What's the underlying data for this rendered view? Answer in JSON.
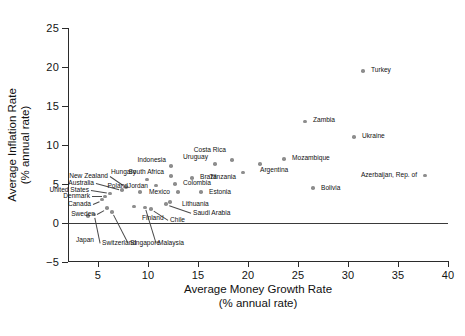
{
  "chart_data": {
    "type": "scatter",
    "title": "",
    "xlabel": "Average Money Growth Rate",
    "xlabel2": "(% annual rate)",
    "ylabel": "Average Inflation Rate",
    "ylabel2": "(% annual rate)",
    "xlim": [
      2.0,
      40.0
    ],
    "ylim": [
      -5,
      25
    ],
    "xticks": [
      5,
      10,
      15,
      20,
      25,
      30,
      35,
      40
    ],
    "yticks": [
      -5,
      0,
      5,
      10,
      15,
      20,
      25
    ],
    "grid": false,
    "legend": "none",
    "zero_reference_line": 0,
    "points": [
      {
        "name": "Switzerland",
        "x": 4.6,
        "y": 1.1,
        "lx": 5.2,
        "ly": -2.6,
        "anchor": "start",
        "leader": true
      },
      {
        "name": "Japan",
        "x": 4.0,
        "y": 0.9,
        "lx": 2.6,
        "ly": -2.2,
        "anchor": "start",
        "leader": false
      },
      {
        "name": "Singapore",
        "x": 6.4,
        "y": 1.4,
        "lx": 8.0,
        "ly": -2.6,
        "anchor": "start",
        "leader": true
      },
      {
        "name": "Sweden",
        "x": 5.9,
        "y": 1.9,
        "lx": 4.9,
        "ly": 1.2,
        "anchor": "end",
        "leader": true
      },
      {
        "name": "Canada",
        "x": 5.4,
        "y": 3.0,
        "lx": 4.5,
        "ly": 2.5,
        "anchor": "end",
        "leader": true
      },
      {
        "name": "Denmark",
        "x": 5.7,
        "y": 3.4,
        "lx": 4.4,
        "ly": 3.4,
        "anchor": "end",
        "leader": true
      },
      {
        "name": "United States",
        "x": 6.2,
        "y": 3.8,
        "lx": 4.3,
        "ly": 4.2,
        "anchor": "end",
        "leader": true
      },
      {
        "name": "Australia",
        "x": 7.4,
        "y": 4.2,
        "lx": 4.8,
        "ly": 5.1,
        "anchor": "end",
        "leader": true
      },
      {
        "name": "New Zealand",
        "x": 7.8,
        "y": 4.6,
        "lx": 6.2,
        "ly": 6.0,
        "anchor": "end",
        "leader": true
      },
      {
        "name": "Malaysia",
        "x": 9.7,
        "y": 2.0,
        "lx": 10.8,
        "ly": -2.6,
        "anchor": "start",
        "leader": true
      },
      {
        "name": "Finland",
        "x": 8.6,
        "y": 2.1,
        "lx": 9.2,
        "ly": 0.6,
        "anchor": "start",
        "leader": false
      },
      {
        "name": "Chile",
        "x": 10.3,
        "y": 1.8,
        "lx": 12.0,
        "ly": 0.4,
        "anchor": "start",
        "leader": true
      },
      {
        "name": "Poland",
        "x": 9.2,
        "y": 4.0,
        "lx": 8.2,
        "ly": 4.7,
        "anchor": "end",
        "leader": false
      },
      {
        "name": "Hungary",
        "x": 9.9,
        "y": 5.6,
        "lx": 9.0,
        "ly": 6.5,
        "anchor": "end",
        "leader": false
      },
      {
        "name": "Jordan",
        "x": 10.8,
        "y": 4.8,
        "lx": 10.2,
        "ly": 4.8,
        "anchor": "end",
        "leader": false
      },
      {
        "name": "Lithuania",
        "x": 12.2,
        "y": 2.7,
        "lx": 13.2,
        "ly": 2.4,
        "anchor": "start",
        "leader": false
      },
      {
        "name": "Saudi Arabia",
        "x": 11.8,
        "y": 2.4,
        "lx": 14.3,
        "ly": 1.3,
        "anchor": "start",
        "leader": true
      },
      {
        "name": "Mexico",
        "x": 13.0,
        "y": 4.0,
        "lx": 12.4,
        "ly": 4.0,
        "anchor": "end",
        "leader": false
      },
      {
        "name": "Colombia",
        "x": 12.7,
        "y": 5.0,
        "lx": 13.3,
        "ly": 5.1,
        "anchor": "start",
        "leader": false
      },
      {
        "name": "South Africa",
        "x": 12.3,
        "y": 6.0,
        "lx": 11.8,
        "ly": 6.5,
        "anchor": "end",
        "leader": false
      },
      {
        "name": "Indonesia",
        "x": 12.3,
        "y": 7.3,
        "lx": 12.0,
        "ly": 8.1,
        "anchor": "end",
        "leader": false
      },
      {
        "name": "Brazil",
        "x": 14.4,
        "y": 5.8,
        "lx": 15.0,
        "ly": 5.9,
        "anchor": "start",
        "leader": false
      },
      {
        "name": "Estonia",
        "x": 15.3,
        "y": 4.0,
        "lx": 15.9,
        "ly": 4.0,
        "anchor": "start",
        "leader": false
      },
      {
        "name": "Uruguay",
        "x": 16.7,
        "y": 7.6,
        "lx": 16.2,
        "ly": 8.5,
        "anchor": "end",
        "leader": false
      },
      {
        "name": "Costa Rica",
        "x": 18.4,
        "y": 8.1,
        "lx": 18.0,
        "ly": 9.3,
        "anchor": "end",
        "leader": false
      },
      {
        "name": "Tanzania",
        "x": 19.5,
        "y": 6.5,
        "lx": 19.0,
        "ly": 5.9,
        "anchor": "end",
        "leader": false
      },
      {
        "name": "Argentina",
        "x": 21.2,
        "y": 7.6,
        "lx": 21.0,
        "ly": 6.8,
        "anchor": "start",
        "leader": false
      },
      {
        "name": "Mozambique",
        "x": 23.6,
        "y": 8.2,
        "lx": 24.2,
        "ly": 8.3,
        "anchor": "start",
        "leader": false
      },
      {
        "name": "Zambia",
        "x": 25.7,
        "y": 13.0,
        "lx": 26.3,
        "ly": 13.2,
        "anchor": "start",
        "leader": false
      },
      {
        "name": "Bolivia",
        "x": 26.5,
        "y": 4.5,
        "lx": 27.1,
        "ly": 4.5,
        "anchor": "start",
        "leader": false
      },
      {
        "name": "Turkey",
        "x": 31.5,
        "y": 19.5,
        "lx": 32.1,
        "ly": 19.6,
        "anchor": "start",
        "leader": false
      },
      {
        "name": "Ukraine",
        "x": 30.6,
        "y": 11.0,
        "lx": 31.2,
        "ly": 11.1,
        "anchor": "start",
        "leader": false
      },
      {
        "name": "Azerbaijan, Rep. of",
        "x": 37.7,
        "y": 6.1,
        "lx": 37.1,
        "ly": 6.1,
        "anchor": "end",
        "leader": false
      }
    ]
  },
  "figure": {
    "marker_color": "#8d8d8d",
    "axis_color": "#2b2b2b",
    "text_color": "#111111",
    "background": "#ffffff"
  }
}
